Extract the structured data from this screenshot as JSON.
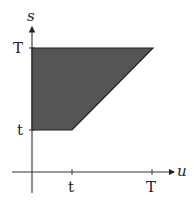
{
  "diagram": {
    "type": "region-plot",
    "axes": {
      "x_label": "u",
      "y_label": "s",
      "x_ticks": [
        {
          "label": "t",
          "value": "t"
        },
        {
          "label": "T",
          "value": "T"
        }
      ],
      "y_ticks": [
        {
          "label": "t",
          "value": "t"
        },
        {
          "label": "T",
          "value": "T"
        }
      ]
    },
    "region": {
      "description": "Shaded region: 0 ≤ u, t ≤ s ≤ T, u ≤ s",
      "vertices": [
        {
          "u": "0",
          "s": "t"
        },
        {
          "u": "t",
          "s": "t"
        },
        {
          "u": "T",
          "s": "T"
        },
        {
          "u": "0",
          "s": "T"
        }
      ],
      "fill_color": "#555555",
      "stroke_color": "#222222"
    }
  }
}
